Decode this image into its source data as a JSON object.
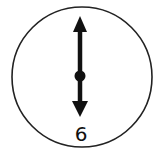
{
  "diagram": {
    "type": "clock-face",
    "numerals": [
      {
        "label": "6",
        "position": "bottom"
      }
    ],
    "hands": {
      "minute_hand": {
        "points_to": 12,
        "style": "arrow"
      },
      "hour_hand": {
        "points_to": 6,
        "style": "arrow"
      }
    },
    "time_shown": "6:00",
    "colors": {
      "stroke": "#222222",
      "hands": "#111111",
      "background": "#ffffff"
    }
  }
}
